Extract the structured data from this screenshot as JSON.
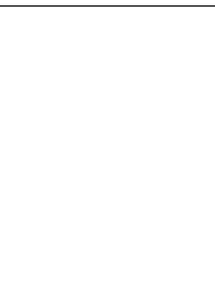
{
  "figure": {
    "panels": [
      {
        "id": "top",
        "description": "Transmembrane alpha-helix in a lipid bilayer with a loop above",
        "lipids_left": 6,
        "lipids_right": 5,
        "helix_turns": 4
      },
      {
        "id": "bottom",
        "description": "Charged lipid bilayer with an unstructured protein chain containing a helix below",
        "lipids": 13,
        "upper_charges": "+−",
        "lower_charges": "−+",
        "helix_turns": 4
      }
    ],
    "colors": {
      "line": "#6e6e6e",
      "background": "#ffffff"
    }
  }
}
